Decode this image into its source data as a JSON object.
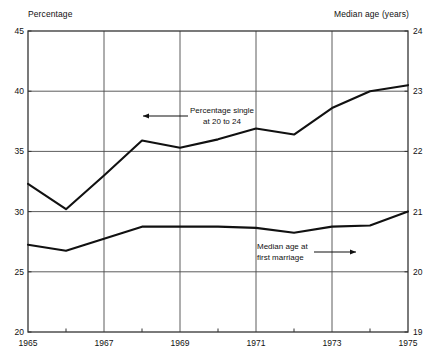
{
  "chart_data": {
    "type": "line",
    "title": "",
    "subtitle": "",
    "xlabel": "",
    "ylabel": "Percentage",
    "y2label": "Median age  (years)",
    "x": [
      1965,
      1966,
      1967,
      1968,
      1969,
      1970,
      1971,
      1972,
      1973,
      1974,
      1975
    ],
    "xlim": [
      1965,
      1975
    ],
    "ylim": [
      20,
      45
    ],
    "y2lim": [
      19,
      24
    ],
    "xticks": [
      1965,
      1967,
      1969,
      1971,
      1973,
      1975
    ],
    "xtick_labels": [
      "1965",
      "1967",
      "1969",
      "1971",
      "1973",
      "1975"
    ],
    "xminor_ticks": [
      1966,
      1968,
      1970,
      1972,
      1974
    ],
    "yticks": [
      20,
      25,
      30,
      35,
      40,
      45
    ],
    "ytick_labels": [
      "20",
      "25",
      "30",
      "35",
      "40",
      "45"
    ],
    "y2ticks": [
      19,
      20,
      21,
      22,
      23,
      24
    ],
    "y2tick_labels": [
      "19",
      "20",
      "21",
      "22",
      "23",
      "24"
    ],
    "grid": true,
    "grid_axes": "both",
    "legend": "none",
    "series": [
      {
        "name": "Percentage single at 20 to 24",
        "axis": "left",
        "values": [
          32.3,
          30.2,
          33.0,
          35.9,
          35.3,
          36.0,
          36.9,
          36.4,
          38.6,
          40.0,
          40.5
        ]
      },
      {
        "name": "Median age at first marriage",
        "axis": "right",
        "values": [
          20.45,
          20.35,
          20.55,
          20.75,
          20.75,
          20.75,
          20.73,
          20.65,
          20.75,
          20.77,
          21.0
        ]
      }
    ],
    "annotations": [
      {
        "id": "upper",
        "lines": [
          "Percentage single",
          "at 20 to 24"
        ],
        "arrow": "left",
        "target_x": 1967.6,
        "target_series": "Percentage single at 20 to 24"
      },
      {
        "id": "lower",
        "lines": [
          "Median age at",
          "first marriage"
        ],
        "arrow": "right",
        "target_x": 1972.6,
        "target_series": "Median age at first marriage"
      }
    ]
  },
  "axes": {
    "left_title": "Percentage",
    "right_title": "Median age  (years)"
  },
  "annotation_upper": {
    "line1": "Percentage single",
    "line2": "at 20 to 24"
  },
  "annotation_lower": {
    "line1": "Median age at",
    "line2": "first marriage"
  },
  "colors": {
    "line": "#111111",
    "grid": "#4a4a4a",
    "frame": "#333333",
    "background": "#ffffff"
  }
}
